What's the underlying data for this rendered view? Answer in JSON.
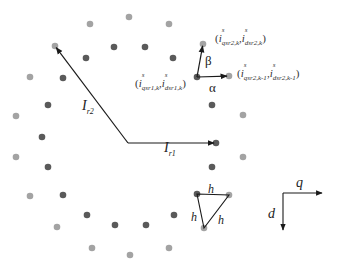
{
  "colors": {
    "outer_dot": "#a3a3a3",
    "inner_dot": "#5a5a5a",
    "line": "#1a1a1a",
    "background": "#ffffff"
  },
  "dots": {
    "outer": [
      [
        90,
        24
      ],
      [
        129,
        17
      ],
      [
        169,
        24
      ],
      [
        55,
        46
      ],
      [
        30,
        77
      ],
      [
        16,
        116
      ],
      [
        16,
        157
      ],
      [
        30,
        196
      ],
      [
        57,
        227
      ],
      [
        92,
        248
      ],
      [
        130,
        255
      ],
      [
        169,
        248
      ],
      [
        204,
        228
      ],
      [
        229,
        195
      ],
      [
        243,
        157
      ],
      [
        243,
        115
      ],
      [
        229,
        76
      ],
      [
        203,
        44
      ]
    ],
    "inner": [
      [
        114,
        47
      ],
      [
        145,
        47
      ],
      [
        173,
        58
      ],
      [
        86,
        58
      ],
      [
        63,
        78
      ],
      [
        48,
        105
      ],
      [
        42,
        137
      ],
      [
        48,
        167
      ],
      [
        63,
        195
      ],
      [
        87,
        215
      ],
      [
        115,
        225
      ],
      [
        146,
        225
      ],
      [
        174,
        215
      ],
      [
        197,
        194
      ],
      [
        212,
        167
      ],
      [
        216,
        143
      ],
      [
        212,
        105
      ],
      [
        197,
        77
      ]
    ]
  },
  "vectors": {
    "origin": [
      128,
      143
    ],
    "I_r1": {
      "label": "I",
      "sub": "r1",
      "to": [
        216,
        143
      ]
    },
    "I_r2": {
      "label": "I",
      "sub": "r2",
      "to": [
        55,
        46
      ]
    }
  },
  "local_vectors": {
    "origin_point": [
      197,
      77
    ],
    "alpha": {
      "label": "α",
      "to": [
        229,
        76
      ]
    },
    "beta": {
      "label": "β",
      "to": [
        203,
        44
      ]
    }
  },
  "coordinate_labels": {
    "p1": {
      "text": "(i^s_{qsr1,k}, i^s_{dsr1,k})",
      "i": "i",
      "sup": "s",
      "q_sub": "qsr1,k",
      "d_sub": "dsr1,k"
    },
    "p2": {
      "text": "(i^s_{qsr2,k}, i^s_{dsr2,k})",
      "i": "i",
      "sup": "s",
      "q_sub": "qsr2,k",
      "d_sub": "dsr2,k"
    },
    "p3": {
      "text": "(i^s_{qsr2,k-1}, i^s_{dsr2,k-1})",
      "i": "i",
      "sup": "s",
      "q_sub": "qsr2,k-1",
      "d_sub": "dsr2,k-1"
    }
  },
  "triangle": {
    "vertices": [
      [
        197,
        194
      ],
      [
        229,
        195
      ],
      [
        204,
        228
      ]
    ],
    "side_label": "h",
    "labels": [
      "h",
      "h",
      "h"
    ]
  },
  "axes": {
    "q_label": "q",
    "d_label": "d",
    "origin": [
      283,
      193
    ],
    "q_end": [
      322,
      193
    ],
    "d_end": [
      283,
      230
    ]
  },
  "punct": {
    "open": "(",
    "close": ")",
    "comma": ","
  }
}
